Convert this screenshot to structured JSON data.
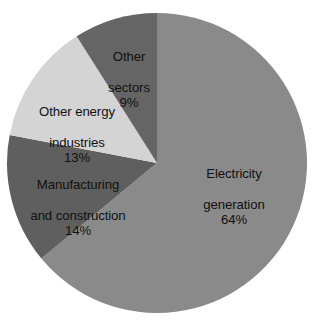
{
  "chart_data": {
    "type": "pie",
    "title": "",
    "subtitle": "",
    "xlabel": "",
    "ylabel": "",
    "legend_position": "none",
    "grid": false,
    "labels_inside": true,
    "unit": "%",
    "start_angle_deg": 0,
    "direction": "clockwise",
    "categories": [
      "Electricity generation",
      "Manufacturing and construction",
      "Other energy industries",
      "Other sectors"
    ],
    "values": [
      64,
      14,
      13,
      9
    ],
    "colors": [
      "#8a8a8a",
      "#5f5f5f",
      "#d4d4d4",
      "#656565"
    ],
    "slices": [
      {
        "name": "Electricity generation",
        "label_line1": "Electricity",
        "label_line2": "generation",
        "value": 64,
        "value_label": "64%",
        "color": "#8a8a8a",
        "label_color": "#111111"
      },
      {
        "name": "Manufacturing and construction",
        "label_line1": "Manufacturing",
        "label_line2": "and construction",
        "value": 14,
        "value_label": "14%",
        "color": "#5f5f5f",
        "label_color": "#111111"
      },
      {
        "name": "Other energy industries",
        "label_line1": "Other energy",
        "label_line2": "industries",
        "value": 13,
        "value_label": "13%",
        "color": "#d4d4d4",
        "label_color": "#111111"
      },
      {
        "name": "Other sectors",
        "label_line1": "Other",
        "label_line2": "sectors",
        "value": 9,
        "value_label": "9%",
        "color": "#656565",
        "label_color": "#111111"
      }
    ]
  },
  "canvas": {
    "background": "#ffffff",
    "center_x": 157,
    "center_y": 163,
    "radius": 150
  }
}
